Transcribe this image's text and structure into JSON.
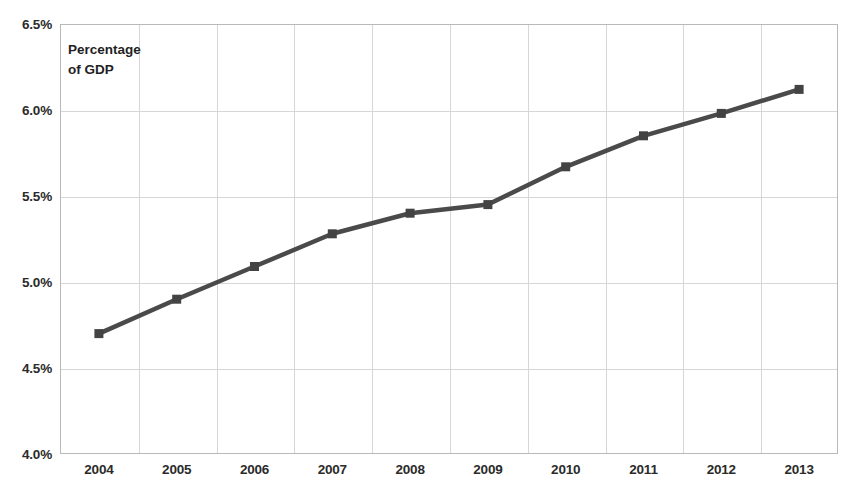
{
  "chart_data": {
    "type": "line",
    "title": "",
    "annotation": "Percentage\nof GDP",
    "xlabel": "",
    "ylabel": "Percentage of GDP",
    "categories": [
      "2004",
      "2005",
      "2006",
      "2007",
      "2008",
      "2009",
      "2010",
      "2011",
      "2012",
      "2013"
    ],
    "x": [
      2004,
      2005,
      2006,
      2007,
      2008,
      2009,
      2010,
      2011,
      2012,
      2013
    ],
    "values": [
      4.7,
      4.9,
      5.09,
      5.28,
      5.4,
      5.45,
      5.67,
      5.85,
      5.98,
      6.12
    ],
    "series": [
      {
        "name": "Percentage of GDP",
        "values": [
          4.7,
          4.9,
          5.09,
          5.28,
          5.4,
          5.45,
          5.67,
          5.85,
          5.98,
          6.12
        ]
      }
    ],
    "ylim": [
      4.0,
      6.5
    ],
    "ytick_labels": [
      "6.5%",
      "6.0%",
      "5.5%",
      "5.0%",
      "4.5%",
      "4.0%"
    ],
    "ytick_values": [
      6.5,
      6.0,
      5.5,
      5.0,
      4.5,
      4.0
    ],
    "xtick_labels": [
      "2004",
      "2005",
      "2006",
      "2007",
      "2008",
      "2009",
      "2010",
      "2011",
      "2012",
      "2013"
    ],
    "grid": true,
    "legend": "none",
    "marker": "square",
    "line_color": "#4a4a4a",
    "marker_color": "#434343",
    "grid_color": "#d6d6d6",
    "axis_color": "#b9b9b9",
    "background": "#ffffff"
  }
}
